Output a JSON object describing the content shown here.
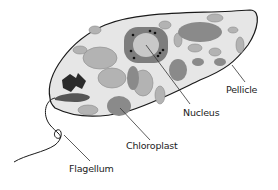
{
  "diagram": {
    "labels": [
      {
        "id": "pellicle",
        "text": "Pellicle"
      },
      {
        "id": "nucleus",
        "text": "Nucleus"
      },
      {
        "id": "chloroplast",
        "text": "Chloroplast"
      },
      {
        "id": "flagellum",
        "text": "Flagellum"
      }
    ],
    "colors": {
      "cell_fill": "#e6e6e6",
      "outline": "#1a1a1a",
      "organelle_light": "#b3b3b3",
      "organelle_mid": "#8a8a8a",
      "organelle_dark": "#555555",
      "nucleus_outer": "#7d7d7d",
      "nucleus_inner": "#c8c8c8",
      "eyespot": "#2b2b2b"
    }
  }
}
